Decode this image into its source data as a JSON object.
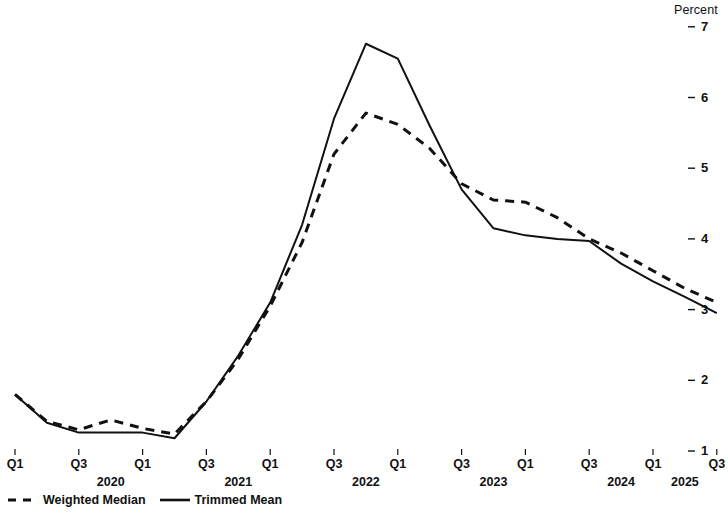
{
  "chart_data": {
    "type": "line",
    "title": "",
    "subtitle": "",
    "xlabel": "",
    "ylabel": "Percent",
    "ylim": [
      1,
      7
    ],
    "yticks": [
      1,
      2,
      3,
      4,
      5,
      6,
      7
    ],
    "ytick_labels": [
      "1",
      "2",
      "3",
      "4",
      "5",
      "6",
      "7"
    ],
    "grid": false,
    "legend_position": "bottom-left",
    "x": [
      "2020Q1",
      "2020Q2",
      "2020Q3",
      "2020Q4",
      "2021Q1",
      "2021Q2",
      "2021Q3",
      "2021Q4",
      "2022Q1",
      "2022Q2",
      "2022Q3",
      "2022Q4",
      "2023Q1",
      "2023Q2",
      "2023Q3",
      "2023Q4",
      "2024Q1",
      "2024Q2",
      "2024Q3",
      "2024Q4",
      "2025Q1",
      "2025Q2",
      "2025Q3"
    ],
    "xtick_labels": [
      "Q1",
      "",
      "Q3",
      "",
      "Q1",
      "",
      "Q3",
      "",
      "Q1",
      "",
      "Q3",
      "",
      "Q1",
      "",
      "Q3",
      "",
      "Q1",
      "",
      "Q3",
      "",
      "Q1",
      "",
      "Q3"
    ],
    "year_labels": [
      "2020",
      "2021",
      "2022",
      "2023",
      "2024",
      "2025"
    ],
    "year_positions": [
      "2020Q4",
      "2021Q4",
      "2022Q4",
      "2023Q4",
      "2024Q4",
      "2025Q2"
    ],
    "series": [
      {
        "name": "Weighted Median",
        "style": "dashed",
        "color": "#111111",
        "values": [
          1.8,
          1.42,
          1.3,
          1.44,
          1.32,
          1.24,
          1.7,
          2.3,
          3.05,
          3.95,
          5.2,
          5.78,
          5.62,
          5.28,
          4.78,
          4.55,
          4.52,
          4.3,
          4.0,
          3.8,
          3.55,
          3.3,
          3.1
        ]
      },
      {
        "name": "Trimmed Mean",
        "style": "solid",
        "color": "#111111",
        "values": [
          1.8,
          1.4,
          1.26,
          1.26,
          1.26,
          1.18,
          1.7,
          2.35,
          3.1,
          4.2,
          5.7,
          6.76,
          6.55,
          5.6,
          4.7,
          4.15,
          4.05,
          4.0,
          3.97,
          3.65,
          3.4,
          3.18,
          2.95
        ]
      }
    ]
  },
  "axis": {
    "unit_label": "Percent"
  },
  "legend": {
    "items": [
      {
        "label": "Weighted Median",
        "style": "dashed"
      },
      {
        "label": "Trimmed Mean",
        "style": "solid"
      }
    ]
  }
}
